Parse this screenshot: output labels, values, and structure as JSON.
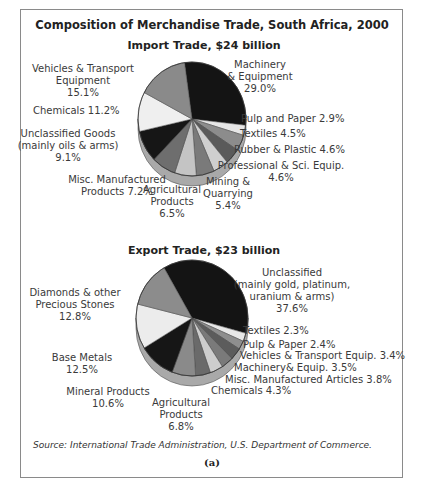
{
  "chart_data": [
    {
      "type": "pie",
      "title": "Import Trade, $24 billion",
      "total": "$24 billion",
      "categories": [
        "Machinery & Equipment",
        "Pulp and Paper",
        "Textiles",
        "Rubber & Plastic",
        "Professional & Sci. Equip.",
        "Mining & Quarrying",
        "Agricultural Products",
        "Misc. Manufactured Products",
        "Unclassified Goods (mainly oils & arms)",
        "Chemicals",
        "Vehicles & Transport Equipment"
      ],
      "values": [
        29.0,
        2.9,
        4.5,
        4.6,
        4.6,
        5.4,
        6.5,
        7.2,
        9.1,
        11.2,
        15.1
      ],
      "units": "%"
    },
    {
      "type": "pie",
      "title": "Export Trade, $23 billion",
      "total": "$23 billion",
      "categories": [
        "Unclassified (mainly gold, platinum, uranium & arms)",
        "Textiles",
        "Pulp & Paper",
        "Vehicles & Transport Equip.",
        "Machinery& Equip.",
        "Misc. Manufactured Articles",
        "Chemicals",
        "Agricultural Products",
        "Mineral Products",
        "Base Metals",
        "Diamonds & other Precious Stones"
      ],
      "values": [
        37.6,
        2.3,
        2.4,
        3.4,
        3.5,
        3.8,
        4.3,
        6.8,
        10.6,
        12.5,
        12.8
      ],
      "units": "%"
    }
  ],
  "figure": {
    "title": "Composition of Merchandise Trade, South Africa, 2000",
    "source": "Source: International Trade Administration, U.S. Department of Commerce.",
    "panel_label": "(a)"
  },
  "import": {
    "title": "Import Trade, $24 billion",
    "colors": [
      "#141414",
      "#e6e6e6",
      "#8c8c8c",
      "#5a5a5a",
      "#cfcfcf",
      "#7a7a7a",
      "#c4c4c4",
      "#6e6e6e",
      "#161616",
      "#efefef",
      "#8a8a8a"
    ],
    "labels": [
      {
        "lines": [
          "Machinery",
          "& Equipment",
          "29.0%"
        ],
        "x": 260,
        "y": 68,
        "anchor": "middle"
      },
      {
        "lines": [
          "Pulp and Paper 2.9%"
        ],
        "x": 241,
        "y": 122,
        "anchor": "start"
      },
      {
        "lines": [
          "Textiles 4.5%"
        ],
        "x": 240,
        "y": 137,
        "anchor": "start"
      },
      {
        "lines": [
          "Rubber & Plastic 4.6%"
        ],
        "x": 234,
        "y": 153,
        "anchor": "start"
      },
      {
        "lines": [
          "Professional & Sci. Equip.",
          "4.6%"
        ],
        "x": 281,
        "y": 169,
        "anchor": "middle"
      },
      {
        "lines": [
          "Mining &",
          "Quarrying",
          "5.4%"
        ],
        "x": 228,
        "y": 185,
        "anchor": "middle"
      },
      {
        "lines": [
          "Agricultural",
          "Products",
          "6.5%"
        ],
        "x": 172,
        "y": 193,
        "anchor": "middle"
      },
      {
        "lines": [
          "Misc. Manufactured",
          "Products 7.2%"
        ],
        "x": 117,
        "y": 183,
        "anchor": "middle"
      },
      {
        "lines": [
          "Unclassified Goods",
          "(mainly oils & arms)",
          "9.1%"
        ],
        "x": 68,
        "y": 137,
        "anchor": "middle"
      },
      {
        "lines": [
          "Chemicals 11.2%"
        ],
        "x": 33,
        "y": 114,
        "anchor": "start"
      },
      {
        "lines": [
          "Vehicles & Transport",
          "Equipment",
          "15.1%"
        ],
        "x": 83,
        "y": 72,
        "anchor": "middle"
      }
    ]
  },
  "export": {
    "title": "Export Trade, $23 billion",
    "colors": [
      "#141414",
      "#e8e8e8",
      "#8e8e8e",
      "#5c5c5c",
      "#7a7a7a",
      "#cdcdcd",
      "#6a6a6a",
      "#8a8a8a",
      "#161616",
      "#ececec",
      "#8c8c8c"
    ],
    "labels": [
      {
        "lines": [
          "Unclassified",
          "(mainly gold, platinum,",
          "uranium & arms)",
          "37.6%"
        ],
        "x": 292,
        "y": 276,
        "anchor": "middle"
      },
      {
        "lines": [
          "Textiles 2.3%"
        ],
        "x": 243,
        "y": 334,
        "anchor": "start"
      },
      {
        "lines": [
          "Pulp & Paper 2.4%"
        ],
        "x": 243,
        "y": 348,
        "anchor": "start"
      },
      {
        "lines": [
          "Vehicles & Transport Equip. 3.4%"
        ],
        "x": 240,
        "y": 359,
        "anchor": "start"
      },
      {
        "lines": [
          "Machinery& Equip. 3.5%"
        ],
        "x": 234,
        "y": 371,
        "anchor": "start"
      },
      {
        "lines": [
          "Misc. Manufactured Articles 3.8%"
        ],
        "x": 225,
        "y": 383,
        "anchor": "start"
      },
      {
        "lines": [
          "Chemicals 4.3%"
        ],
        "x": 211,
        "y": 394,
        "anchor": "start"
      },
      {
        "lines": [
          "Agricultural",
          "Products",
          "6.8%"
        ],
        "x": 181,
        "y": 406,
        "anchor": "middle"
      },
      {
        "lines": [
          "Mineral Products",
          "10.6%"
        ],
        "x": 108,
        "y": 395,
        "anchor": "middle"
      },
      {
        "lines": [
          "Base Metals",
          "12.5%"
        ],
        "x": 82,
        "y": 361,
        "anchor": "middle"
      },
      {
        "lines": [
          "Diamonds & other",
          "Precious Stones",
          "12.8%"
        ],
        "x": 75,
        "y": 296,
        "anchor": "middle"
      }
    ]
  }
}
